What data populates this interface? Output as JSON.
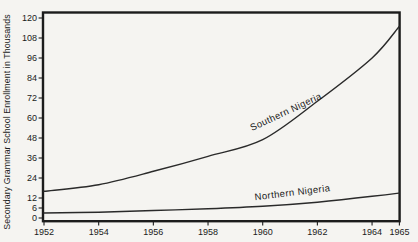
{
  "chart_data": {
    "type": "line",
    "title": "",
    "xlabel": "",
    "ylabel": "Secondary Grammar School Enrollment in Thousands",
    "x_ticks": [
      "1952",
      "1954",
      "1956",
      "1958",
      "1960",
      "1962",
      "1964",
      "1965"
    ],
    "y_ticks": [
      0,
      6,
      12,
      24,
      36,
      48,
      60,
      72,
      84,
      96,
      108,
      120
    ],
    "xlim": [
      1952,
      1965
    ],
    "ylim": [
      0,
      120
    ],
    "grid": false,
    "frame_color": "#1c1c1c",
    "line_color": "#2a2a2a",
    "legend_position": "inline-labels",
    "series": [
      {
        "name": "Southern Nigeria",
        "x": [
          1952,
          1954,
          1956,
          1958,
          1960,
          1962,
          1964,
          1965
        ],
        "values": [
          16,
          20,
          28,
          37,
          47,
          70,
          96,
          115
        ],
        "label": {
          "x": 1960.9,
          "y": 62,
          "rotation_deg": -25
        }
      },
      {
        "name": "Northern Nigeria",
        "x": [
          1952,
          1954,
          1956,
          1958,
          1960,
          1962,
          1964,
          1965
        ],
        "values": [
          3,
          3.5,
          4.5,
          5.5,
          7,
          9.5,
          13,
          15
        ],
        "label": {
          "x": 1961.1,
          "y": 13.4,
          "rotation_deg": -7
        }
      }
    ]
  }
}
